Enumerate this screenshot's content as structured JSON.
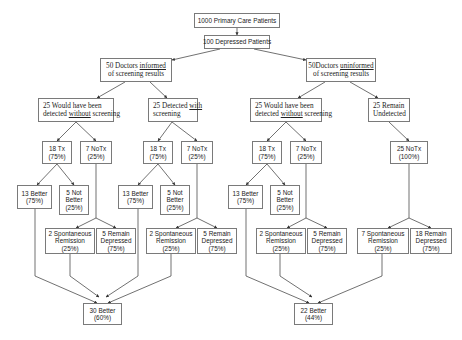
{
  "diagram": {
    "type": "flowchart",
    "nodes": [
      {
        "id": "root",
        "x": 194,
        "y": 13,
        "w": 86,
        "h": 15,
        "style": "sans",
        "lines": [
          "1000 Primary Care Patients"
        ]
      },
      {
        "id": "dep",
        "x": 204,
        "y": 35,
        "w": 66,
        "h": 14,
        "style": "sans",
        "lines": [
          "100 Depressed Patients"
        ]
      },
      {
        "id": "inf",
        "x": 100,
        "y": 58,
        "w": 72,
        "h": 24,
        "style": "serif center",
        "lines": [
          "50 Doctors <u>informed</u>",
          "of screening results"
        ]
      },
      {
        "id": "uninf",
        "x": 306,
        "y": 58,
        "w": 70,
        "h": 24,
        "style": "serif center",
        "lines": [
          "50Doctors <u>uninformed</u>",
          "of screening results"
        ]
      },
      {
        "id": "L_would",
        "x": 38,
        "y": 98,
        "w": 76,
        "h": 24,
        "style": "serif",
        "lines": [
          "25 Would have been",
          "detected <u>without</u> screening"
        ]
      },
      {
        "id": "L_det",
        "x": 148,
        "y": 98,
        "w": 50,
        "h": 24,
        "style": "serif",
        "lines": [
          "25 Detected <u>with</u>",
          "screening"
        ]
      },
      {
        "id": "R_would",
        "x": 250,
        "y": 98,
        "w": 72,
        "h": 24,
        "style": "serif",
        "lines": [
          "25 Would have been",
          "detected <u>without</u> screening"
        ]
      },
      {
        "id": "R_und",
        "x": 368,
        "y": 98,
        "w": 42,
        "h": 24,
        "style": "serif",
        "lines": [
          "25 Remain",
          "Undetected"
        ]
      },
      {
        "id": "A_tx",
        "x": 42,
        "y": 141,
        "w": 30,
        "h": 23,
        "style": "sans",
        "lines": [
          "18 Tx",
          "(75%)"
        ]
      },
      {
        "id": "A_no",
        "x": 80,
        "y": 141,
        "w": 32,
        "h": 23,
        "style": "sans",
        "lines": [
          "7  NoTx",
          "(25%)"
        ]
      },
      {
        "id": "B_tx",
        "x": 143,
        "y": 141,
        "w": 30,
        "h": 23,
        "style": "sans",
        "lines": [
          "18 Tx",
          "(75%)"
        ]
      },
      {
        "id": "B_no",
        "x": 181,
        "y": 141,
        "w": 32,
        "h": 23,
        "style": "sans",
        "lines": [
          "7  NoTx",
          "(25%)"
        ]
      },
      {
        "id": "C_tx",
        "x": 252,
        "y": 141,
        "w": 30,
        "h": 23,
        "style": "sans",
        "lines": [
          "18 Tx",
          "(75%)"
        ]
      },
      {
        "id": "C_no",
        "x": 290,
        "y": 141,
        "w": 32,
        "h": 23,
        "style": "sans",
        "lines": [
          "7  NoTx",
          "(25%)"
        ]
      },
      {
        "id": "D_no",
        "x": 390,
        "y": 141,
        "w": 38,
        "h": 23,
        "style": "sans",
        "lines": [
          "25  NoTx",
          "(100%)"
        ]
      },
      {
        "id": "A_b",
        "x": 17,
        "y": 185,
        "w": 35,
        "h": 24,
        "style": "sans",
        "lines": [
          "13 Better",
          "(75%)"
        ]
      },
      {
        "id": "A_nb",
        "x": 59,
        "y": 185,
        "w": 30,
        "h": 30,
        "style": "sans",
        "lines": [
          "5 Not",
          "Better",
          "(25%)"
        ]
      },
      {
        "id": "B_b",
        "x": 118,
        "y": 185,
        "w": 35,
        "h": 24,
        "style": "sans",
        "lines": [
          "13 Better",
          "(75%)"
        ]
      },
      {
        "id": "B_nb",
        "x": 160,
        "y": 185,
        "w": 30,
        "h": 30,
        "style": "sans",
        "lines": [
          "5 Not",
          "Better",
          "(25%)"
        ]
      },
      {
        "id": "C_b",
        "x": 228,
        "y": 185,
        "w": 35,
        "h": 24,
        "style": "sans",
        "lines": [
          "13 Better",
          "(75%)"
        ]
      },
      {
        "id": "C_nb",
        "x": 270,
        "y": 185,
        "w": 30,
        "h": 30,
        "style": "sans",
        "lines": [
          "5 Not",
          "Better",
          "(25%)"
        ]
      },
      {
        "id": "A_sr",
        "x": 45,
        "y": 228,
        "w": 50,
        "h": 26,
        "style": "sans",
        "lines": [
          "2 Spontaneous",
          "Remission",
          "(25%)"
        ]
      },
      {
        "id": "A_rd",
        "x": 96,
        "y": 228,
        "w": 40,
        "h": 26,
        "style": "sans",
        "lines": [
          "5 Remain",
          "Depressed",
          "(75%)"
        ]
      },
      {
        "id": "B_sr",
        "x": 146,
        "y": 228,
        "w": 50,
        "h": 26,
        "style": "sans",
        "lines": [
          "2 Spontaneous",
          "Remission",
          "(25%)"
        ]
      },
      {
        "id": "B_rd",
        "x": 197,
        "y": 228,
        "w": 40,
        "h": 26,
        "style": "sans",
        "lines": [
          "5 Remain",
          "Depressed",
          "(75%)"
        ]
      },
      {
        "id": "C_sr",
        "x": 256,
        "y": 228,
        "w": 50,
        "h": 26,
        "style": "sans",
        "lines": [
          "2 Spontaneous",
          "Remission",
          "(25%)"
        ]
      },
      {
        "id": "C_rd",
        "x": 307,
        "y": 228,
        "w": 40,
        "h": 26,
        "style": "sans",
        "lines": [
          "5 Remain",
          "Depressed",
          "(75%)"
        ]
      },
      {
        "id": "D_sr",
        "x": 357,
        "y": 228,
        "w": 52,
        "h": 26,
        "style": "sans",
        "lines": [
          "7 Spontaneous",
          "Remission",
          "(25%)"
        ]
      },
      {
        "id": "D_rd",
        "x": 410,
        "y": 228,
        "w": 42,
        "h": 26,
        "style": "sans",
        "lines": [
          "18 Remain",
          "Depressed",
          "(75%)"
        ]
      },
      {
        "id": "L_total",
        "x": 83,
        "y": 303,
        "w": 39,
        "h": 22,
        "style": "sans",
        "lines": [
          "30 Better",
          "(60%)"
        ]
      },
      {
        "id": "R_total",
        "x": 294,
        "y": 303,
        "w": 39,
        "h": 22,
        "style": "sans",
        "lines": [
          "22 Better",
          "(44%)"
        ]
      }
    ],
    "edges": [
      {
        "pts": [
          [
            237,
            28
          ],
          [
            237,
            35
          ]
        ],
        "arrow": true
      },
      {
        "pts": [
          [
            220,
            49
          ],
          [
            172,
            60
          ]
        ],
        "arrow": true
      },
      {
        "pts": [
          [
            254,
            49
          ],
          [
            306,
            60
          ]
        ],
        "arrow": true
      },
      {
        "pts": [
          [
            125,
            82
          ],
          [
            97,
            98
          ]
        ],
        "arrow": true
      },
      {
        "pts": [
          [
            150,
            82
          ],
          [
            167,
            98
          ]
        ],
        "arrow": true
      },
      {
        "pts": [
          [
            325,
            82
          ],
          [
            298,
            98
          ]
        ],
        "arrow": true
      },
      {
        "pts": [
          [
            350,
            82
          ],
          [
            378,
            98
          ]
        ],
        "arrow": true
      },
      {
        "pts": [
          [
            76,
            122
          ],
          [
            57,
            141
          ]
        ],
        "arrow": true
      },
      {
        "pts": [
          [
            76,
            122
          ],
          [
            96,
            141
          ]
        ],
        "arrow": true
      },
      {
        "pts": [
          [
            172,
            122
          ],
          [
            158,
            141
          ]
        ],
        "arrow": true
      },
      {
        "pts": [
          [
            172,
            122
          ],
          [
            197,
            141
          ]
        ],
        "arrow": true
      },
      {
        "pts": [
          [
            286,
            122
          ],
          [
            267,
            141
          ]
        ],
        "arrow": true
      },
      {
        "pts": [
          [
            286,
            122
          ],
          [
            306,
            141
          ]
        ],
        "arrow": true
      },
      {
        "pts": [
          [
            389,
            122
          ],
          [
            409,
            141
          ]
        ],
        "arrow": true
      },
      {
        "pts": [
          [
            57,
            164
          ],
          [
            37,
            185
          ]
        ],
        "arrow": true
      },
      {
        "pts": [
          [
            57,
            164
          ],
          [
            74,
            185
          ]
        ],
        "arrow": true
      },
      {
        "pts": [
          [
            158,
            164
          ],
          [
            138,
            185
          ]
        ],
        "arrow": true
      },
      {
        "pts": [
          [
            158,
            164
          ],
          [
            175,
            185
          ]
        ],
        "arrow": true
      },
      {
        "pts": [
          [
            267,
            164
          ],
          [
            246,
            185
          ]
        ],
        "arrow": true
      },
      {
        "pts": [
          [
            267,
            164
          ],
          [
            285,
            185
          ]
        ],
        "arrow": true
      },
      {
        "pts": [
          [
            96,
            164
          ],
          [
            96,
            218
          ]
        ],
        "arrow": false
      },
      {
        "pts": [
          [
            96,
            218
          ],
          [
            76,
            228
          ]
        ],
        "arrow": true
      },
      {
        "pts": [
          [
            96,
            218
          ],
          [
            116,
            228
          ]
        ],
        "arrow": true
      },
      {
        "pts": [
          [
            197,
            164
          ],
          [
            197,
            218
          ]
        ],
        "arrow": false
      },
      {
        "pts": [
          [
            197,
            218
          ],
          [
            176,
            228
          ]
        ],
        "arrow": true
      },
      {
        "pts": [
          [
            197,
            218
          ],
          [
            217,
            228
          ]
        ],
        "arrow": true
      },
      {
        "pts": [
          [
            306,
            164
          ],
          [
            306,
            218
          ]
        ],
        "arrow": false
      },
      {
        "pts": [
          [
            306,
            218
          ],
          [
            287,
            228
          ]
        ],
        "arrow": true
      },
      {
        "pts": [
          [
            306,
            218
          ],
          [
            327,
            228
          ]
        ],
        "arrow": true
      },
      {
        "pts": [
          [
            409,
            164
          ],
          [
            409,
            218
          ]
        ],
        "arrow": false
      },
      {
        "pts": [
          [
            409,
            218
          ],
          [
            388,
            228
          ]
        ],
        "arrow": true
      },
      {
        "pts": [
          [
            409,
            218
          ],
          [
            431,
            228
          ]
        ],
        "arrow": true
      },
      {
        "pts": [
          [
            35,
            209
          ],
          [
            35,
            276
          ],
          [
            97,
            303
          ]
        ],
        "arrow": true
      },
      {
        "pts": [
          [
            70,
            254
          ],
          [
            70,
            276
          ],
          [
            99,
            297
          ]
        ],
        "arrow": true
      },
      {
        "pts": [
          [
            138,
            209
          ],
          [
            138,
            276
          ],
          [
            106,
            297
          ]
        ],
        "arrow": true
      },
      {
        "pts": [
          [
            171,
            254
          ],
          [
            171,
            276
          ],
          [
            108,
            303
          ]
        ],
        "arrow": true
      },
      {
        "pts": [
          [
            246,
            209
          ],
          [
            246,
            276
          ],
          [
            309,
            303
          ]
        ],
        "arrow": true
      },
      {
        "pts": [
          [
            280,
            254
          ],
          [
            280,
            276
          ],
          [
            312,
            297
          ]
        ],
        "arrow": true
      },
      {
        "pts": [
          [
            382,
            254
          ],
          [
            382,
            276
          ],
          [
            318,
            303
          ]
        ],
        "arrow": true
      }
    ],
    "colors": {
      "line": "#333333",
      "border": "#7a7a7a",
      "text": "#222222"
    }
  }
}
